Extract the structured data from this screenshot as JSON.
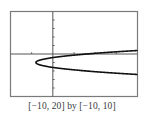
{
  "chart_data": {
    "type": "line",
    "title": "",
    "xlabel": "",
    "ylabel": "",
    "xlim": [
      -10,
      20
    ],
    "ylim": [
      -10,
      10
    ],
    "xscale_ticks": 5,
    "yscale_ticks": 2,
    "grid": false,
    "legend": null,
    "series": [
      {
        "name": "x = 3(y + 2)^2 - 4",
        "description": "Sideways parabola opening right, vertex near (-4, -2)",
        "vertex": [
          -4,
          -2
        ],
        "points": [
          [
            20,
            0.83
          ],
          [
            15,
            0.52
          ],
          [
            10,
            0.16
          ],
          [
            5,
            -0.27
          ],
          [
            0,
            -0.85
          ],
          [
            -3,
            -1.42
          ],
          [
            -4,
            -2
          ],
          [
            -3,
            -2.58
          ],
          [
            0,
            -3.15
          ],
          [
            5,
            -3.73
          ],
          [
            10,
            -4.16
          ],
          [
            15,
            -4.52
          ],
          [
            20,
            -4.83
          ]
        ]
      }
    ],
    "caption": "[−10, 20] by [−10, 10]"
  },
  "style": {
    "frame_color": "#7a7a7a",
    "axis_color": "#555555",
    "curve_color": "#111111"
  },
  "caption": "[−10, 20] by [−10, 10]"
}
